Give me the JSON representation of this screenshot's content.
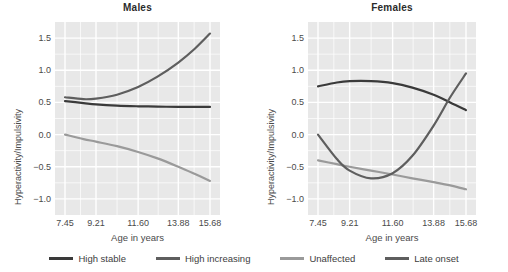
{
  "chart_data": {
    "type": "line",
    "title": "",
    "xlabel": "Age in years",
    "ylabel": "Hyperactivity/Impulsivity",
    "grid": true,
    "legend_position": "bottom",
    "xlim": [
      7.45,
      15.68
    ],
    "ylim": [
      -1.25,
      1.75
    ],
    "x_tick_labels": [
      "7.45",
      "9.21",
      "11.60",
      "13.88",
      "15.68"
    ],
    "x_tick_values": [
      7.45,
      9.21,
      11.6,
      13.88,
      15.68
    ],
    "y_tick_labels": [
      "1.5",
      "1.0",
      "0.5",
      "0.0",
      "−0.5",
      "−1.0"
    ],
    "y_tick_values": [
      1.5,
      1.0,
      0.5,
      0.0,
      -0.5,
      -1.0
    ],
    "panels": [
      {
        "label": "Males",
        "series": [
          {
            "name": "High stable",
            "color": "#3a3a3a",
            "x": [
              7.45,
              8.5,
              9.21,
              10.4,
              11.6,
              12.7,
              13.88,
              14.8,
              15.68
            ],
            "values": [
              0.52,
              0.49,
              0.47,
              0.45,
              0.44,
              0.435,
              0.43,
              0.43,
              0.43
            ]
          },
          {
            "name": "High increasing",
            "color": "#5e5e5e",
            "x": [
              7.45,
              8.5,
              9.21,
              10.4,
              11.6,
              12.7,
              13.88,
              14.8,
              15.68
            ],
            "values": [
              0.58,
              0.55,
              0.56,
              0.62,
              0.74,
              0.9,
              1.12,
              1.33,
              1.57
            ]
          },
          {
            "name": "Unaffected",
            "color": "#9a9a9a",
            "x": [
              7.45,
              8.5,
              9.21,
              10.4,
              11.6,
              12.7,
              13.88,
              14.8,
              15.68
            ],
            "values": [
              0.0,
              -0.07,
              -0.11,
              -0.18,
              -0.27,
              -0.37,
              -0.5,
              -0.61,
              -0.72
            ]
          }
        ]
      },
      {
        "label": "Females",
        "series": [
          {
            "name": "High stable",
            "color": "#3a3a3a",
            "x": [
              7.45,
              8.5,
              9.21,
              10.4,
              11.6,
              12.7,
              13.88,
              14.8,
              15.68
            ],
            "values": [
              0.75,
              0.81,
              0.83,
              0.83,
              0.8,
              0.73,
              0.62,
              0.5,
              0.38
            ]
          },
          {
            "name": "Unaffected",
            "color": "#9a9a9a",
            "x": [
              7.45,
              8.5,
              9.21,
              10.4,
              11.6,
              12.7,
              13.88,
              14.8,
              15.68
            ],
            "values": [
              -0.4,
              -0.46,
              -0.5,
              -0.56,
              -0.62,
              -0.68,
              -0.74,
              -0.79,
              -0.85
            ]
          },
          {
            "name": "Late onset",
            "color": "#5e5e5e",
            "x": [
              7.45,
              8.5,
              9.21,
              10.4,
              11.6,
              12.7,
              13.88,
              14.8,
              15.68
            ],
            "values": [
              0.0,
              -0.38,
              -0.56,
              -0.68,
              -0.6,
              -0.33,
              0.14,
              0.58,
              0.95
            ]
          }
        ]
      }
    ],
    "legend": [
      {
        "name": "High stable",
        "color": "#3a3a3a"
      },
      {
        "name": "High increasing",
        "color": "#5e5e5e"
      },
      {
        "name": "Unaffected",
        "color": "#9a9a9a"
      },
      {
        "name": "Late onset",
        "color": "#5e5e5e"
      }
    ]
  },
  "theme": {
    "panel_background": "#e8e8e8",
    "gridline_color": "#ffffff",
    "text_color": "#4a4a4a",
    "title_color": "#2b2b2b"
  }
}
